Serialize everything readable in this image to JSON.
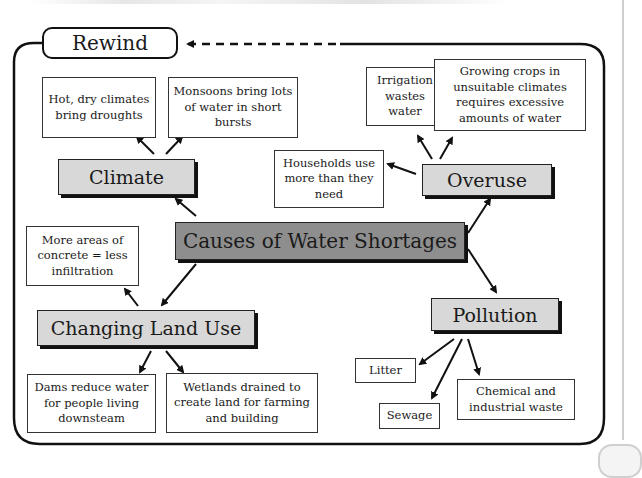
{
  "header": {
    "rewind_label": "Rewind"
  },
  "diagram": {
    "central_topic": "Causes of Water Shortages",
    "branches": [
      {
        "label": "Climate",
        "causes": [
          "Hot, dry climates bring droughts",
          "Monsoons bring lots of water in short bursts"
        ]
      },
      {
        "label": "Overuse",
        "causes": [
          "Irrigation wastes water",
          "Growing crops in unsuitable climates requires excessive amounts of water",
          "Households use more than they need"
        ]
      },
      {
        "label": "Changing Land Use",
        "causes": [
          "More areas of concrete = less infiltration",
          "Dams reduce water for people living downsteam",
          "Wetlands drained to create land for farming and building"
        ]
      },
      {
        "label": "Pollution",
        "causes": [
          "Litter",
          "Sewage",
          "Chemical and industrial waste"
        ]
      }
    ]
  },
  "colors": {
    "central_fill": "#8e8e8e",
    "topic_fill": "#d8d8d8",
    "line": "#111111"
  }
}
